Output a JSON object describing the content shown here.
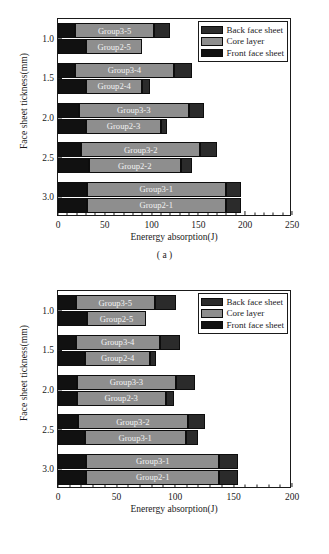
{
  "figure": {
    "panels": [
      {
        "caption": "( a )",
        "xlabel": "Enerergy absorption(J)",
        "ylabel": "Face sheet tickness(mm)",
        "xticks": [
          "0",
          "50",
          "100",
          "150",
          "200",
          "250"
        ],
        "yticks": [
          "3.0",
          "2.5",
          "2.0",
          "1.5",
          "1.0"
        ],
        "legend": [
          {
            "label": "Back face sheet",
            "color": "#2b2b2b"
          },
          {
            "label": "Core layer",
            "color": "#8e8e8e"
          },
          {
            "label": "Front face sheet",
            "color": "#111111"
          }
        ]
      },
      {
        "caption": "( b )",
        "xlabel": "Enerergy absorption(J)",
        "ylabel": "Face sheet tickness(mm)",
        "xticks": [
          "0",
          "50",
          "100",
          "150",
          "200"
        ],
        "yticks": [
          "3.0",
          "2.5",
          "2.0",
          "1.5",
          "1.0"
        ],
        "legend": [
          {
            "label": "Back face sheet",
            "color": "#2b2b2b"
          },
          {
            "label": "Core layer",
            "color": "#8e8e8e"
          },
          {
            "label": "Front face sheet",
            "color": "#111111"
          }
        ]
      }
    ]
  },
  "chart_data": [
    {
      "type": "bar",
      "orientation": "horizontal",
      "stacked": true,
      "title": "",
      "xlabel": "Enerergy absorption(J)",
      "ylabel": "Face sheet tickness(mm)",
      "xlim": [
        0,
        250
      ],
      "ylim": [
        0.75,
        3.25
      ],
      "xticks": [
        0,
        50,
        100,
        150,
        200,
        250
      ],
      "yticks": [
        1.0,
        1.5,
        2.0,
        2.5,
        3.0
      ],
      "grid": false,
      "legend_position": "top-right",
      "segment_names": [
        "Front face sheet",
        "Core layer",
        "Back face sheet"
      ],
      "segment_colors": [
        "#111111",
        "#8e8e8e",
        "#2b2b2b"
      ],
      "bars": [
        {
          "label": "Group3-5",
          "thickness": 3.0,
          "front": 18,
          "core": 85,
          "back": 17,
          "total": 120
        },
        {
          "label": "Group2-5",
          "thickness": 3.0,
          "front": 30,
          "core": 60,
          "back": 0,
          "total": 90
        },
        {
          "label": "Group3-4",
          "thickness": 2.5,
          "front": 18,
          "core": 106,
          "back": 19,
          "total": 143
        },
        {
          "label": "Group2-4",
          "thickness": 2.5,
          "front": 30,
          "core": 60,
          "back": 8,
          "total": 98
        },
        {
          "label": "Group3-3",
          "thickness": 2.0,
          "front": 22,
          "core": 118,
          "back": 16,
          "total": 156
        },
        {
          "label": "Group2-3",
          "thickness": 2.0,
          "front": 30,
          "core": 80,
          "back": 6,
          "total": 116
        },
        {
          "label": "Group3-2",
          "thickness": 1.5,
          "front": 25,
          "core": 127,
          "back": 18,
          "total": 170
        },
        {
          "label": "Group2-2",
          "thickness": 1.5,
          "front": 33,
          "core": 98,
          "back": 12,
          "total": 143
        },
        {
          "label": "Group3-1",
          "thickness": 1.0,
          "front": 31,
          "core": 148,
          "back": 16,
          "total": 195
        },
        {
          "label": "Group2-1",
          "thickness": 1.0,
          "front": 31,
          "core": 148,
          "back": 16,
          "total": 195
        }
      ]
    },
    {
      "type": "bar",
      "orientation": "horizontal",
      "stacked": true,
      "title": "",
      "xlabel": "Enerergy absorption(J)",
      "ylabel": "Face sheet tickness(mm)",
      "xlim": [
        0,
        200
      ],
      "ylim": [
        0.75,
        3.25
      ],
      "xticks": [
        0,
        50,
        100,
        150,
        200
      ],
      "yticks": [
        1.0,
        1.5,
        2.0,
        2.5,
        3.0
      ],
      "grid": false,
      "legend_position": "top-right",
      "segment_names": [
        "Front face sheet",
        "Core layer",
        "Back face sheet"
      ],
      "segment_colors": [
        "#111111",
        "#8e8e8e",
        "#2b2b2b"
      ],
      "bars": [
        {
          "label": "Group3-5",
          "thickness": 3.0,
          "front": 15,
          "core": 68,
          "back": 18,
          "total": 101
        },
        {
          "label": "Group2-5",
          "thickness": 3.0,
          "front": 25,
          "core": 50,
          "back": 0,
          "total": 75
        },
        {
          "label": "Group3-4",
          "thickness": 2.5,
          "front": 15,
          "core": 72,
          "back": 17,
          "total": 104
        },
        {
          "label": "Group2-4",
          "thickness": 2.5,
          "front": 23,
          "core": 56,
          "back": 5,
          "total": 84
        },
        {
          "label": "Group3-3",
          "thickness": 2.0,
          "front": 16,
          "core": 85,
          "back": 16,
          "total": 117
        },
        {
          "label": "Group2-3",
          "thickness": 2.0,
          "front": 16,
          "core": 76,
          "back": 7,
          "total": 99
        },
        {
          "label": "Group3-2",
          "thickness": 1.5,
          "front": 17,
          "core": 94,
          "back": 15,
          "total": 126
        },
        {
          "label": "Group3-1",
          "thickness": 1.5,
          "front": 23,
          "core": 86,
          "back": 11,
          "total": 120
        },
        {
          "label": "Group3-1",
          "thickness": 1.0,
          "front": 24,
          "core": 114,
          "back": 16,
          "total": 154
        },
        {
          "label": "Group2-1",
          "thickness": 1.0,
          "front": 24,
          "core": 114,
          "back": 16,
          "total": 154
        }
      ]
    }
  ]
}
